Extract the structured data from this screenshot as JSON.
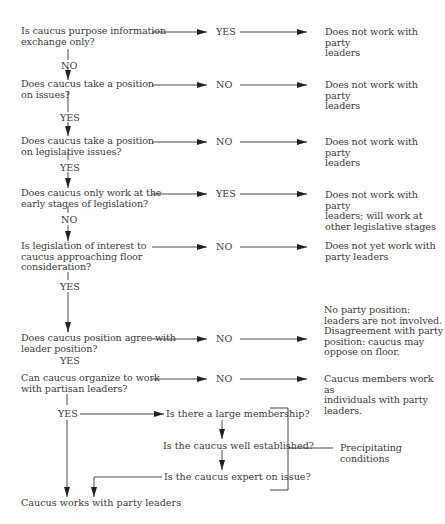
{
  "flowchart": {
    "questions": [
      {
        "id": "q1",
        "text": "Is caucus purpose information\nexchange only?",
        "side_answer": "YES",
        "down_answer": "NO",
        "outcome": "Does not work with party\nleaders"
      },
      {
        "id": "q2",
        "text": "Does caucus take a position\non issues?",
        "side_answer": "NO",
        "down_answer": "YES",
        "outcome": "Does not work with party\nleaders"
      },
      {
        "id": "q3",
        "text": "Does caucus take a position\non legislative issues?",
        "side_answer": "NO",
        "down_answer": "YES",
        "outcome": "Does not work with party\nleaders"
      },
      {
        "id": "q4",
        "text": "Does caucus only work at the\nearly stages of legislation?",
        "side_answer": "YES",
        "down_answer": "NO",
        "outcome": "Does not work with party\nleaders; will work at\nother legislative stages"
      },
      {
        "id": "q5",
        "text": "Is legislation of interest to\ncaucus approaching floor\nconsideration?",
        "side_answer": "NO",
        "down_answer": "YES",
        "outcome": "Does not yet work with\nparty leaders"
      },
      {
        "id": "q6",
        "text": "Does caucus position agree with\nleader position?",
        "side_answer": "NO",
        "down_answer": "YES",
        "outcome": "No party position:\nleaders are not involved.\nDisagreement with party\nposition: caucus may\noppose on floor."
      },
      {
        "id": "q7",
        "text": "Can caucus organize to work\nwith partisan leaders?",
        "side_answer": "NO",
        "down_answer": "YES",
        "outcome": "Caucus members work as\nindividuals with party\nleaders."
      }
    ],
    "conditions": [
      "Is there a large membership?",
      "Is the caucus well established?",
      "Is the caucus expert on issue?"
    ],
    "conditions_label": "Precipitating\nconditions",
    "final_outcome": "Caucus works with party leaders"
  },
  "colors": {
    "line": "#2a2a2a",
    "text": "#3a3a3a",
    "background": "#ffffff"
  }
}
